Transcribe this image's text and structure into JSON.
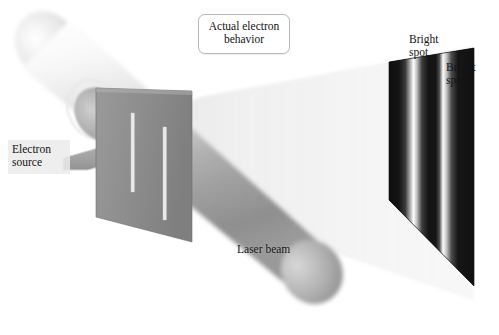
{
  "figure": {
    "background_color": "#ffffff"
  },
  "callout": {
    "text": "Actual electron\nbehavior",
    "border_color": "#b9b9b9",
    "background_color": "#ffffff"
  },
  "labels": {
    "electron_source": "Electron\nsource",
    "laser_beam": "Laser beam",
    "bright_spot_1": "Bright\nspot",
    "bright_spot_2": "Bright\nspot"
  },
  "scene": {
    "laser_cylinder": {
      "name": "laser beam cylinder",
      "color_light": "#fbfbfb",
      "color_mid": "#c8c8c8",
      "color_dark": "#8d8d8d"
    },
    "barrier": {
      "name": "double-slit barrier plate",
      "color": "#8e8e8e",
      "slit_color": "#e7e7e7",
      "slit_count": 2
    },
    "electron_source_arrow": {
      "name": "electron source arrow",
      "color": "#a3a3a3",
      "direction": "right"
    },
    "diverging_beam": {
      "name": "diverging light beam",
      "color": "#f0f0f0"
    },
    "detector_screen": {
      "name": "detector screen with interference fringes",
      "dark_color": "#101010",
      "bright_color": "#ffffff",
      "fringe_count": 2,
      "bright_fringe_positions": [
        0.3,
        0.62
      ]
    }
  }
}
